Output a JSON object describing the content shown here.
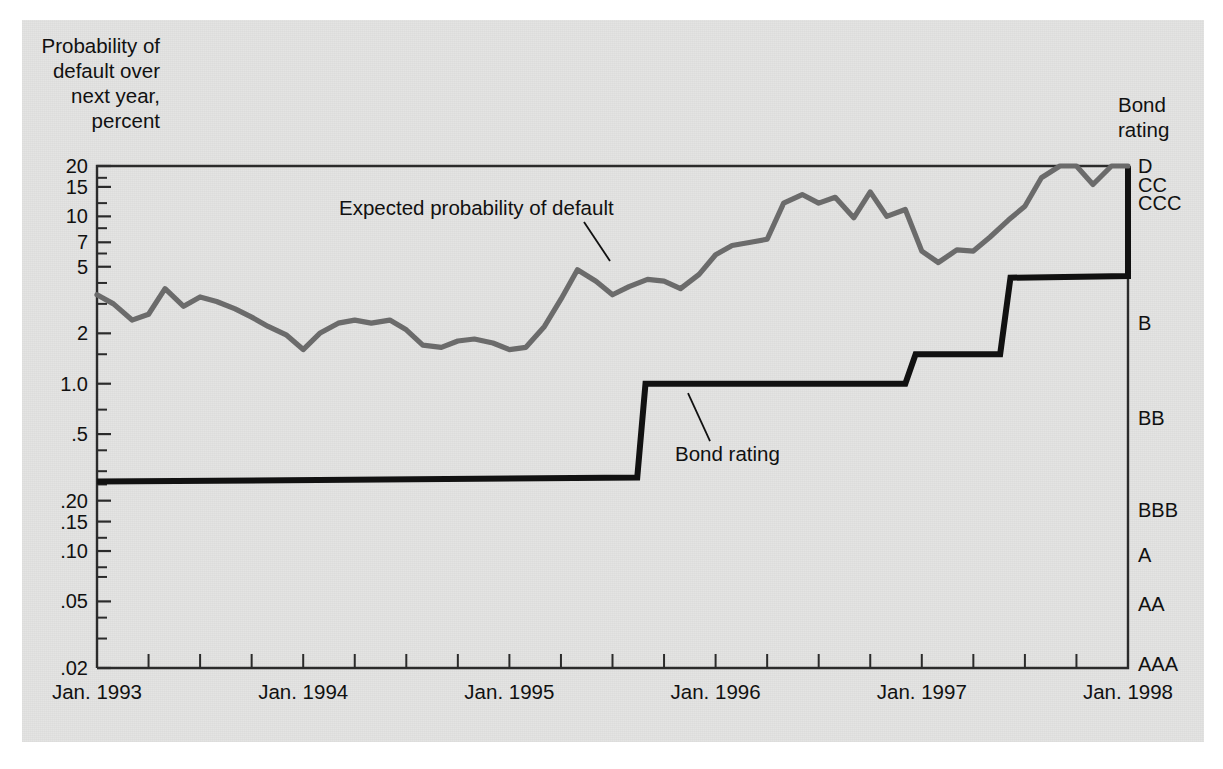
{
  "axes": {
    "y_title": "Probability of\ndefault over\nnext year,\npercent",
    "right_title": "Bond\nrating",
    "y_ticks": [
      {
        "value": 20,
        "label": "20"
      },
      {
        "value": 15,
        "label": "15"
      },
      {
        "value": 10,
        "label": "10"
      },
      {
        "value": 7,
        "label": "7"
      },
      {
        "value": 5,
        "label": "5"
      },
      {
        "value": 2,
        "label": "2"
      },
      {
        "value": 1.0,
        "label": "1.0"
      },
      {
        "value": 0.5,
        "label": ".5"
      },
      {
        "value": 0.2,
        "label": ".20"
      },
      {
        "value": 0.15,
        "label": ".15"
      },
      {
        "value": 0.1,
        "label": ".10"
      },
      {
        "value": 0.05,
        "label": ".05"
      },
      {
        "value": 0.02,
        "label": ".02"
      }
    ],
    "y_minor_ticks": [
      17,
      12,
      8.5,
      6,
      4,
      3,
      1.5,
      0.7,
      0.4,
      0.3,
      0.25,
      0.12,
      0.08,
      0.07,
      0.04,
      0.03
    ],
    "x_ticks": [
      {
        "value": 1993.0,
        "label": "Jan. 1993"
      },
      {
        "value": 1994.0,
        "label": "Jan. 1994"
      },
      {
        "value": 1995.0,
        "label": "Jan. 1995"
      },
      {
        "value": 1996.0,
        "label": "Jan. 1996"
      },
      {
        "value": 1997.0,
        "label": "Jan. 1997"
      },
      {
        "value": 1998.0,
        "label": "Jan. 1998"
      }
    ],
    "rating_labels": [
      {
        "label": "D",
        "value": 20
      },
      {
        "label": "CC",
        "value": 15.5
      },
      {
        "label": "CCC",
        "value": 12
      },
      {
        "label": "B",
        "value": 2.3
      },
      {
        "label": "BB",
        "value": 0.62
      },
      {
        "label": "BBB",
        "value": 0.175
      },
      {
        "label": "A",
        "value": 0.095
      },
      {
        "label": "AA",
        "value": 0.048
      },
      {
        "label": "AAA",
        "value": 0.021
      }
    ]
  },
  "annotations": [
    {
      "id": "expected-probability",
      "text": "Expected probability of default"
    },
    {
      "id": "bond-rating",
      "text": "Bond rating"
    }
  ],
  "colors": {
    "paper": "#e3e3e2",
    "expected_line": "#6b6b6b",
    "rating_line": "#111111",
    "frame": "#2b2b2b"
  },
  "chart_data": {
    "type": "line",
    "title": "",
    "xlabel": "",
    "ylabel": "Probability of default over next year, percent",
    "log_y": true,
    "ylim": [
      0.02,
      20
    ],
    "xlim": [
      1993.0,
      1998.0
    ],
    "grid": false,
    "legend": "annotations-inline",
    "series": [
      {
        "name": "Expected probability of default",
        "color": "#6b6b6b",
        "x": [
          1993.0,
          1993.08,
          1993.17,
          1993.25,
          1993.33,
          1993.42,
          1993.5,
          1993.58,
          1993.67,
          1993.75,
          1993.83,
          1993.92,
          1994.0,
          1994.08,
          1994.17,
          1994.25,
          1994.33,
          1994.42,
          1994.5,
          1994.58,
          1994.67,
          1994.75,
          1994.83,
          1994.92,
          1995.0,
          1995.08,
          1995.17,
          1995.25,
          1995.33,
          1995.42,
          1995.5,
          1995.58,
          1995.67,
          1995.75,
          1995.83,
          1995.92,
          1996.0,
          1996.08,
          1996.17,
          1996.25,
          1996.33,
          1996.42,
          1996.5,
          1996.58,
          1996.67,
          1996.75,
          1996.83,
          1996.92,
          1997.0,
          1997.08,
          1997.17,
          1997.25,
          1997.33,
          1997.42,
          1997.5,
          1997.58,
          1997.67,
          1997.75,
          1997.83,
          1997.92,
          1998.0
        ],
        "y": [
          3.4,
          3.0,
          2.4,
          2.6,
          3.7,
          2.9,
          3.3,
          3.1,
          2.8,
          2.5,
          2.2,
          1.95,
          1.6,
          2.0,
          2.3,
          2.4,
          2.3,
          2.4,
          2.1,
          1.7,
          1.65,
          1.8,
          1.85,
          1.75,
          1.6,
          1.65,
          2.2,
          3.2,
          4.8,
          4.1,
          3.4,
          3.8,
          4.2,
          4.1,
          3.7,
          4.5,
          5.9,
          6.7,
          7.0,
          7.3,
          12.0,
          13.5,
          12.0,
          13.0,
          9.8,
          14.0,
          10.0,
          11.0,
          6.2,
          5.3,
          6.3,
          6.2,
          7.5,
          9.5,
          11.5,
          17.0,
          20.0,
          20.0,
          15.5,
          20.0,
          20.0
        ]
      },
      {
        "name": "Bond rating",
        "color": "#111111",
        "step": true,
        "x": [
          1993.0,
          1995.62,
          1995.66,
          1996.92,
          1996.97,
          1997.38,
          1997.43,
          1998.0
        ],
        "y": [
          0.26,
          0.275,
          1.0,
          1.0,
          1.5,
          1.5,
          4.3,
          4.4
        ],
        "rating_steps": [
          {
            "from": 1993.0,
            "to": 1995.62,
            "rating": "BBB"
          },
          {
            "from": 1995.66,
            "to": 1996.92,
            "rating": "BB"
          },
          {
            "from": 1996.97,
            "to": 1997.38,
            "rating": "BB-"
          },
          {
            "from": 1997.43,
            "to": 1998.0,
            "rating": "B"
          }
        ],
        "final_rise_to": "D"
      }
    ]
  }
}
